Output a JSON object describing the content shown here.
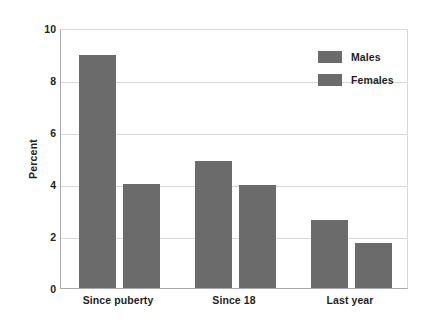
{
  "chart_data": {
    "type": "bar",
    "title": "",
    "xlabel": "",
    "ylabel": "Percent",
    "ylim": [
      0,
      10
    ],
    "yticks": [
      "10",
      "8",
      "6",
      "4",
      "2",
      "0"
    ],
    "ytick_values": [
      10,
      8,
      6,
      4,
      2,
      0
    ],
    "grid": true,
    "legend_position": "top-right",
    "categories": [
      "Since puberty",
      "Since 18",
      "Last year"
    ],
    "series": [
      {
        "name": "Males",
        "color": "#6b6b6b",
        "values": [
          8.95,
          4.9,
          2.6
        ]
      },
      {
        "name": "Females",
        "color": "#6b6b6b",
        "values": [
          4.0,
          3.95,
          1.75
        ]
      }
    ]
  },
  "legend": {
    "items": [
      {
        "label": "Males"
      },
      {
        "label": "Females"
      }
    ]
  },
  "colors": {
    "bar": "#6b6b6b",
    "grid": "#d8d8d8",
    "axis": "#a9a9a9",
    "text": "#231f20",
    "background": "#ffffff"
  }
}
